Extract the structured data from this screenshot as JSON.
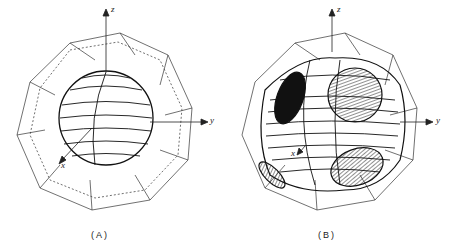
{
  "figure": {
    "panels": [
      {
        "id": "A",
        "caption": "(A)",
        "axes": {
          "z": "z",
          "y": "y",
          "x": "x"
        },
        "description": "Near-spherical surface inside truncated octahedron"
      },
      {
        "id": "B",
        "caption": "(B)",
        "axes": {
          "z": "z",
          "y": "y",
          "x": "x"
        },
        "description": "Multiply-connected surface with necks touching hexagonal faces (hatched and black contact regions)"
      }
    ]
  }
}
